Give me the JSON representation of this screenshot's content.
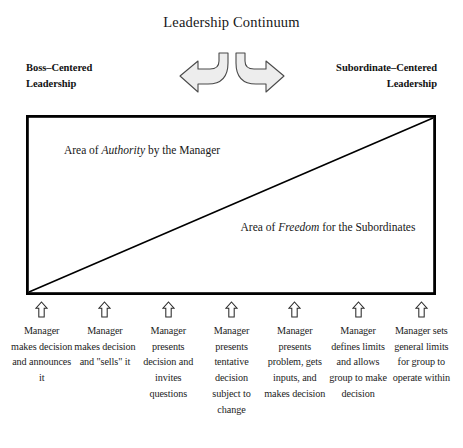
{
  "title": "Leadership Continuum",
  "endpoints": {
    "left": "Boss–Centered\nLeadership",
    "right": "Subordinate–Centered\nLeadership"
  },
  "arrows": {
    "left_arrow_name": "curved-left-arrow",
    "right_arrow_name": "curved-right-arrow",
    "fill": "#ededed",
    "stroke": "#4a4a4a"
  },
  "diagram": {
    "border_color": "#000000",
    "diagonal_color": "#000000",
    "authority_label": {
      "prefix": "Area of ",
      "emphasis": "Authority",
      "suffix": " by the Manager"
    },
    "freedom_label": {
      "prefix": "Area of ",
      "emphasis": "Freedom",
      "suffix": " for the Subordinates"
    }
  },
  "columns": [
    {
      "arrow": "up-arrow-icon",
      "text": "Manager makes decision and announces it"
    },
    {
      "arrow": "up-arrow-icon",
      "text": "Manager makes decision and \"sells\" it"
    },
    {
      "arrow": "up-arrow-icon",
      "text": "Manager presents decision and invites questions"
    },
    {
      "arrow": "up-arrow-icon",
      "text": "Manager presents tentative decision subject to change"
    },
    {
      "arrow": "up-arrow-icon",
      "text": "Manager presents problem, gets inputs, and makes decision"
    },
    {
      "arrow": "up-arrow-icon",
      "text": "Manager defines limits and allows group to make decision"
    },
    {
      "arrow": "up-arrow-icon",
      "text": "Manager sets general limits for group to operate within"
    }
  ]
}
